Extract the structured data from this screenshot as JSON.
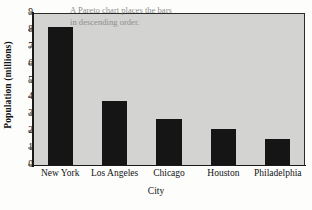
{
  "chart_data": {
    "type": "bar",
    "title": "",
    "subtitle": "",
    "xlabel": "City",
    "ylabel": "Population (millions)",
    "categories": [
      "New York",
      "Los Angeles",
      "Chicago",
      "Houston",
      "Philadelphia"
    ],
    "values": [
      8.2,
      3.8,
      2.75,
      2.15,
      1.55
    ],
    "ylim": [
      0,
      9
    ],
    "ytick_labels": [
      "0",
      "1",
      "2",
      "3",
      "4",
      "5",
      "6",
      "7",
      "8",
      "9"
    ],
    "ytick_values": [
      0,
      1,
      2,
      3,
      4,
      5,
      6,
      7,
      8,
      9
    ],
    "grid": false,
    "legend": "none",
    "bar_color": "#151515",
    "plot_background": "#d3d3d2",
    "annotations": [
      {
        "line1": "A Pareto chart places the bars",
        "line2": "in descending order.",
        "color": "#8e8e8e"
      }
    ]
  }
}
